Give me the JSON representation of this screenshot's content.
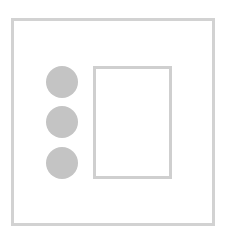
{
  "diagram": {
    "colors": {
      "frame": "#d2d2d2",
      "circle": "#c4c4c4",
      "inner_rect": "#cfcfcf",
      "background": "#ffffff"
    },
    "circles": [
      {
        "id": "circle-1",
        "cx": 62,
        "cy": 82,
        "r": 16
      },
      {
        "id": "circle-2",
        "cx": 62,
        "cy": 122,
        "r": 16
      },
      {
        "id": "circle-3",
        "cx": 62,
        "cy": 163,
        "r": 16
      }
    ]
  }
}
